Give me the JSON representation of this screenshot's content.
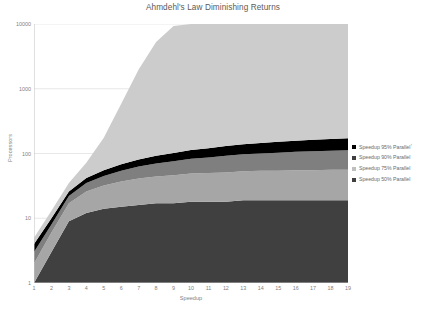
{
  "chart_data": {
    "type": "area",
    "title": "Ahmdehl's Law Diminishing Returns",
    "xlabel": "Speedup",
    "ylabel": "Processors",
    "stacked": true,
    "grid": true,
    "legend_position": "right",
    "yscale": "log",
    "ylim": [
      1,
      10000
    ],
    "y_ticks": [
      "1",
      "10",
      "100",
      "1000",
      "10000"
    ],
    "y_tick_values": [
      1,
      10,
      100,
      1000,
      10000
    ],
    "xlim": [
      1,
      19
    ],
    "x": [
      1,
      2,
      3,
      4,
      5,
      6,
      7,
      8,
      9,
      10,
      11,
      12,
      13,
      14,
      15,
      16,
      17,
      18,
      19
    ],
    "x_ticks": [
      "1",
      "2",
      "3",
      "4",
      "5",
      "6",
      "7",
      "8",
      "9",
      "10",
      "11",
      "12",
      "13",
      "14",
      "15",
      "16",
      "17",
      "18",
      "19"
    ],
    "series": [
      {
        "name": "Speedup 50% Parallel",
        "color": "#404040",
        "values": [
          1,
          3,
          9,
          12,
          14,
          15,
          16,
          17,
          17,
          18,
          18,
          18,
          19,
          19,
          19,
          19,
          19,
          19,
          19
        ]
      },
      {
        "name": "Speedup 75% Parallel",
        "color": "#a6a6a6",
        "values": [
          1,
          3,
          8,
          14,
          18,
          22,
          25,
          27,
          29,
          31,
          32,
          33,
          34,
          35,
          35,
          36,
          36,
          37,
          37
        ]
      },
      {
        "name": "Speedup 90% Parallel",
        "color": "#7f7f7f",
        "values": [
          1,
          2,
          5,
          9,
          13,
          17,
          22,
          26,
          30,
          34,
          37,
          41,
          44,
          46,
          49,
          51,
          53,
          54,
          56
        ]
      },
      {
        "name": "Speedup 95% Parallel",
        "color": "#000000",
        "values": [
          1,
          2,
          4,
          7,
          10,
          14,
          18,
          22,
          26,
          30,
          34,
          38,
          42,
          45,
          49,
          52,
          55,
          58,
          60
        ]
      },
      {
        "name": "Remaining",
        "color": "#cccccc",
        "values": [
          1,
          3,
          9,
          30,
          120,
          520,
          1900,
          5200,
          9200,
          10000,
          10000,
          10000,
          10000,
          10000,
          10000,
          10000,
          10000,
          10000,
          10000
        ]
      }
    ],
    "legend_entries": [
      {
        "label": "Speedup 95% Parallel",
        "color": "#000000",
        "superscript": "↑"
      },
      {
        "label": "Speedup 90% Parallel",
        "color": "#3f3f3f",
        "superscript": ""
      },
      {
        "label": "Speedup 75% Parallel",
        "color": "#bfbfbf",
        "superscript": ""
      },
      {
        "label": "Speedup 50% Parallel",
        "color": "#404040",
        "superscript": ""
      }
    ],
    "colors": {
      "plot_background": "#ffffff",
      "gridline": "#d9d9d9",
      "axis_line": "#bfbfbf",
      "tick_label": "#7f7f7f",
      "title": "#5a5a5a"
    }
  }
}
